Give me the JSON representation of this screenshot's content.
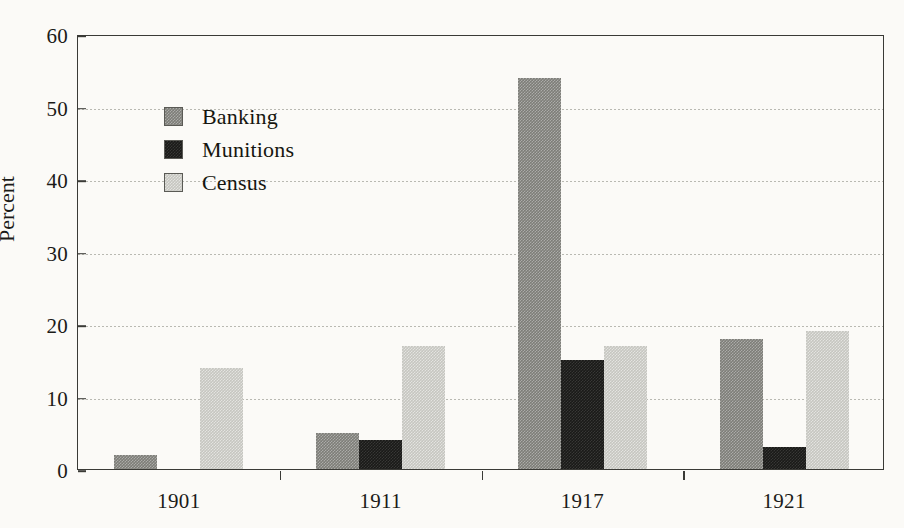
{
  "chart_data": {
    "type": "bar",
    "title": "",
    "xlabel": "",
    "ylabel": "Percent",
    "categories": [
      "1901",
      "1911",
      "1917",
      "1921"
    ],
    "series": [
      {
        "name": "Banking",
        "values": [
          2,
          5,
          54,
          18
        ],
        "color": "#7d7d78"
      },
      {
        "name": "Munitions",
        "values": [
          0,
          4,
          15,
          3
        ],
        "color": "#1a1a18"
      },
      {
        "name": "Census",
        "values": [
          14,
          17,
          17,
          19
        ],
        "color": "#c6c6c0"
      }
    ],
    "ylim": [
      0,
      60
    ],
    "yticks": [
      0,
      10,
      20,
      30,
      40,
      50,
      60
    ],
    "grid": true,
    "legend_position": "top-left"
  },
  "axes": {
    "y_label": "Percent",
    "y_ticks": [
      "0",
      "10",
      "20",
      "30",
      "40",
      "50",
      "60"
    ],
    "x_ticks": [
      "1901",
      "1911",
      "1917",
      "1921"
    ]
  },
  "legend": {
    "entries": [
      {
        "label": "Banking"
      },
      {
        "label": "Munitions"
      },
      {
        "label": "Census"
      }
    ]
  }
}
